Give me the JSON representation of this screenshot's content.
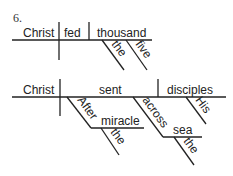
{
  "problem_number": "6.",
  "diagram1": {
    "subject": "Christ",
    "verb": "fed",
    "object": "thousand",
    "modifiers": [
      "the",
      "five"
    ]
  },
  "diagram2": {
    "subject": "Christ",
    "verb": "sent",
    "object": "disciples",
    "object_modifier": "His",
    "phrase1": {
      "preposition": "After",
      "object": "miracle",
      "modifier": "the"
    },
    "phrase2": {
      "preposition": "across",
      "object": "sea",
      "modifier": "the"
    }
  }
}
